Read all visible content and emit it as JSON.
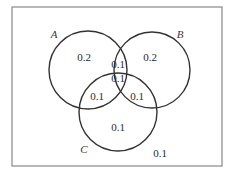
{
  "diagram": {
    "type": "venn-3",
    "frame": {
      "x": 12,
      "y": 7,
      "width": 210,
      "height": 159,
      "stroke": "#888888"
    },
    "circle_stroke": "#333333",
    "sets": [
      {
        "id": "A",
        "label": "A",
        "cx": 88,
        "cy": 70,
        "r": 39,
        "label_x": 54,
        "label_y": 38
      },
      {
        "id": "B",
        "label": "B",
        "cx": 152,
        "cy": 70,
        "r": 38,
        "label_x": 180,
        "label_y": 38
      },
      {
        "id": "C",
        "label": "C",
        "cx": 118,
        "cy": 112,
        "r": 39,
        "label_x": 84,
        "label_y": 153
      }
    ],
    "regions": [
      {
        "id": "A_only",
        "value": "0.2",
        "x": 84,
        "y": 61
      },
      {
        "id": "B_only",
        "value": "0.2",
        "x": 150,
        "y": 61
      },
      {
        "id": "A_and_B_only",
        "value": "0.1",
        "x": 118,
        "y": 68
      },
      {
        "id": "A_and_B_and_C",
        "value": "0.1",
        "x": 118,
        "y": 82
      },
      {
        "id": "A_and_C_only",
        "value": "0.1",
        "x": 97,
        "y": 100
      },
      {
        "id": "B_and_C_only",
        "value": "0.1",
        "x": 137,
        "y": 100
      },
      {
        "id": "C_only",
        "value": "0.1",
        "x": 118,
        "y": 131
      },
      {
        "id": "outside",
        "value": "0.1",
        "x": 160,
        "y": 157
      }
    ]
  }
}
